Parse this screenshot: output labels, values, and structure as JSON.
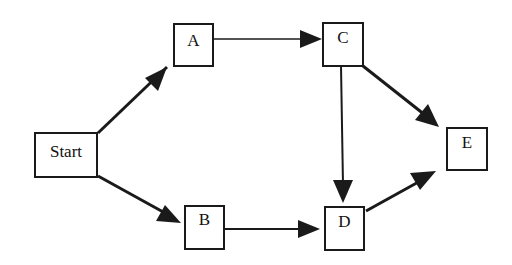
{
  "diagram": {
    "type": "directed-graph",
    "nodes": [
      {
        "id": "start",
        "label": "Start"
      },
      {
        "id": "a",
        "label": "A"
      },
      {
        "id": "b",
        "label": "B"
      },
      {
        "id": "c",
        "label": "C"
      },
      {
        "id": "d",
        "label": "D"
      },
      {
        "id": "e",
        "label": "E"
      }
    ],
    "edges": [
      {
        "from": "Start",
        "to": "A"
      },
      {
        "from": "Start",
        "to": "B"
      },
      {
        "from": "A",
        "to": "C"
      },
      {
        "from": "B",
        "to": "D"
      },
      {
        "from": "C",
        "to": "D"
      },
      {
        "from": "C",
        "to": "E"
      },
      {
        "from": "D",
        "to": "E"
      }
    ],
    "colors": {
      "stroke": "#1a1a1a",
      "background": "#ffffff"
    }
  }
}
